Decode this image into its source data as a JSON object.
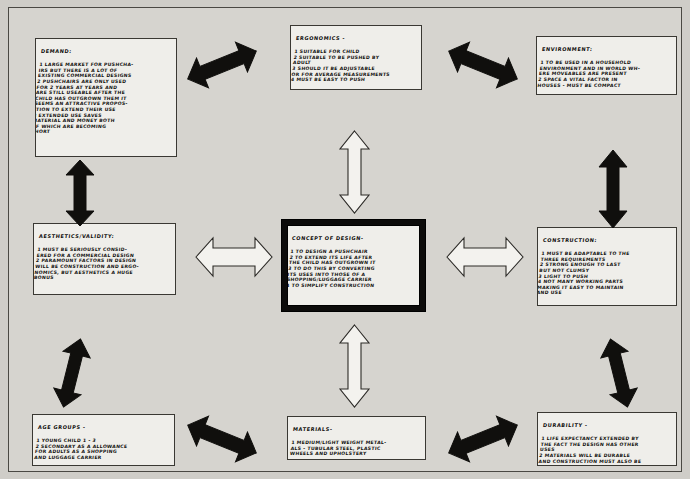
{
  "document": {
    "type": "hand-drawn design specification spider diagram",
    "title_semantic": "design-specification-mind-map"
  },
  "center": {
    "name": "concept-of-design",
    "title": "CONCEPT OF DESIGN-",
    "lines": [
      "1 TO DESIGN A PUSHCHAIR",
      "2 TO EXTEND ITS LIFE AFTER",
      "THE CHILD HAS OUTGROWN IT",
      "3 TO DO THIS BY CONVERTING",
      "ITS USES INTO THOSE OF A",
      "SHOPPING/LUGGAGE CARRIER",
      "4 TO SIMPLIFY CONSTRUCTION"
    ]
  },
  "boxes": {
    "demand": {
      "title": "DEMAND:",
      "lines": [
        "1 LARGE MARKET FOR PUSHCHA-",
        "IRS BUT THERE IS A LOT OF",
        "EXISTING COMMERCIAL DESIGNS",
        "2 PUSHCHAIRS ARE ONLY USED",
        "FOR 2 YEARS AT YEARS AND",
        "ARE STILL USEABLE AFTER THE",
        "CHILD HAS OUTGROWN THEM IT",
        "SEEMS AN ATTRACTIVE PROPOS-",
        "ITION TO EXTEND THEIR USE",
        "3 EXTENDED USE SAVES",
        "MATERIAL AND MONEY BOTH",
        "OF WHICH ARE BECOMING",
        "SHORT"
      ]
    },
    "ergonomics": {
      "title": "ERGONOMICS -",
      "lines": [
        "1 SUITABLE FOR CHILD",
        "2 SUITABLE TO BE PUSHED BY",
        "ADULT",
        "3 SHOULD IT BE ADJUSTABLE",
        "OR FOR AVERAGE MEASUREMENTS",
        "4 MUST BE EASY TO PUSH"
      ]
    },
    "environment": {
      "title": "ENVIRONMENT:",
      "lines": [
        "1 TO BE USED IN A HOUSEHOLD",
        "ENVIRONMENT AND IN WORLD WH-",
        "ERE MOVEABLES ARE PRESENT",
        "2 SPACE A VITAL FACTOR IN",
        "HOUSES - MUST BE COMPACT"
      ]
    },
    "aesthetics": {
      "title": "AESTHETICS/VALIDITY:",
      "lines": [
        "1 MUST BE SERIOUSLY CONSID-",
        "ERED FOR A COMMERCIAL DESIGN",
        "2 PARAMOUNT FACTORS IN DESIGN",
        "WILL BE CONSTRUCTION AND ERGO-",
        "NOMICS, BUT AESTHETICS A HUGE",
        "BONUS"
      ]
    },
    "construction": {
      "title": "CONSTRUCTION:",
      "lines": [
        "1 MUST BE ADAPTABLE TO THE",
        "THREE REQUIREMENTS",
        "2 STRONG ENOUGH TO LAST",
        "BUT NOT CLUMSY",
        "3 LIGHT TO PUSH",
        "4 NOT MANY WORKING PARTS",
        "MAKING IT EASY TO MAINTAIN",
        "AND USE"
      ]
    },
    "age_groups": {
      "title": "AGE GROUPS -",
      "lines": [
        "1 YOUNG CHILD 1 - 3",
        "2 SECONDARY AS A ALLOWANCE",
        "FOR ADULTS AS A SHOPPING",
        "AND LUGGAGE CARRIER"
      ]
    },
    "materials": {
      "title": "MATERIALS-",
      "lines": [
        "1 MEDIUM/LIGHT WEIGHT METAL-",
        "ALS - TUBULAR STEEL, PLASTIC",
        "WHEELS AND UPHOLSTERY"
      ]
    },
    "durability": {
      "title": "DURABILITY -",
      "lines": [
        "1 LIFE EXPECTANCY EXTENDED BY",
        "THE FACT THE DESIGN HAS OTHER",
        "USES",
        "2 MATERIALS WILL BE DURABLE",
        "AND CONSTRUCTION MUST ALSO BE"
      ]
    }
  },
  "arrows": [
    {
      "name": "arrow-demand-ergonomics",
      "style": "solid",
      "orientation": "diagonal"
    },
    {
      "name": "arrow-ergonomics-environment",
      "style": "solid",
      "orientation": "diagonal"
    },
    {
      "name": "arrow-demand-aesthetics",
      "style": "solid",
      "orientation": "vertical"
    },
    {
      "name": "arrow-environment-construction",
      "style": "solid",
      "orientation": "vertical"
    },
    {
      "name": "arrow-ergonomics-concept",
      "style": "hollow",
      "orientation": "vertical"
    },
    {
      "name": "arrow-concept-materials",
      "style": "hollow",
      "orientation": "vertical"
    },
    {
      "name": "arrow-aesthetics-concept",
      "style": "hollow",
      "orientation": "horizontal"
    },
    {
      "name": "arrow-concept-construction",
      "style": "hollow",
      "orientation": "horizontal"
    },
    {
      "name": "arrow-age-materials",
      "style": "solid",
      "orientation": "horizontal"
    },
    {
      "name": "arrow-materials-durability",
      "style": "solid",
      "orientation": "horizontal"
    },
    {
      "name": "arrow-aesthetics-age",
      "style": "solid",
      "orientation": "diagonal"
    },
    {
      "name": "arrow-construction-durability",
      "style": "solid",
      "orientation": "diagonal"
    }
  ],
  "colors": {
    "paper": "#d6d4cf",
    "box_fill": "#efeeea",
    "ink": "#100f0d",
    "frame": "#4a4843"
  }
}
